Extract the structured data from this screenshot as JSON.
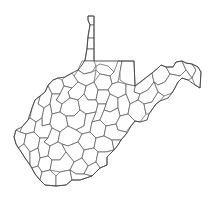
{
  "map": {
    "subject": "West Virginia county boundaries",
    "background": "#ffffff",
    "stroke_color": "#555555",
    "fill_color": "#ffffff",
    "width": 211,
    "height": 206,
    "state_outline": "M88,16 L94,16 L94,61 L134,61 L135,86 L143,80 L152,73 L158,68 L161,65 L166,67 L173,67 L176,62 L182,61 L186,63 L192,64 L198,67 L201,72 L200,88 L195,85 L188,80 L182,78 L178,82 L175,88 L172,93 L168,98 L160,101 L156,104 L149,114 L147,120 L140,122 L135,121 L131,126 L127,133 L121,140 L118,145 L114,150 L107,157 L107,165 L100,168 L92,176 L80,180 L72,180 L66,185 L56,186 L45,185 L40,180 L35,174 L30,165 L25,158 L20,150 L16,144 L14,137 L16,130 L22,127 L28,120 L32,108 L35,100 L40,96 L45,92 L48,85 L53,80 L58,78 L65,77 L72,73 L78,70 L82,65 L85,60 L87,48 L88,36 L90,25 L88,20 Z",
    "counties": [
      "M88,16 L94,16 L94,25 L90,25 L88,20 Z",
      "M90,25 L94,25 L94,38 L88,38 Z",
      "M88,38 L94,38 L94,49 L87,49 Z",
      "M87,49 L94,49 L94,61 L85,61 Z",
      "M82,61 L94,61 L96,66 L92,72 L84,74 L78,70 Z",
      "M96,66 L100,64 L108,66 L114,72 L110,76 L100,74 L96,70 Z",
      "M114,72 L118,61 L122,61 L120,72 L118,82 L112,84 L110,76 Z",
      "M122,61 L134,61 L135,86 L126,84 L120,80 L120,72 Z",
      "M135,86 L143,80 L152,73 L154,82 L148,90 L140,94 L134,92 Z",
      "M152,73 L158,68 L161,65 L166,67 L170,74 L165,82 L158,85 L154,82 Z",
      "M166,67 L173,67 L176,62 L182,61 L186,70 L180,76 L170,74 Z",
      "M182,61 L186,63 L192,64 L196,70 L192,78 L186,70 Z",
      "M192,64 L198,67 L201,72 L200,88 L195,85 L192,78 L196,70 Z",
      "M100,74 L110,76 L112,84 L108,90 L98,90 L94,82 Z",
      "M112,84 L118,82 L126,84 L126,94 L118,98 L110,94 L108,90 Z",
      "M126,84 L135,86 L134,92 L140,94 L138,100 L130,104 L126,94 Z",
      "M154,82 L158,85 L165,82 L170,74 L180,76 L186,70 L192,78 L188,80 L182,78 L178,82 L172,93 L164,96 L158,92 Z",
      "M140,94 L148,90 L154,82 L158,92 L152,102 L144,104 L138,100 Z",
      "M78,70 L84,74 L92,72 L96,70 L94,82 L86,86 L78,82 L74,76 Z",
      "M65,77 L72,73 L74,76 L78,82 L72,88 L64,86 L62,80 Z",
      "M53,80 L58,78 L62,80 L64,86 L60,94 L52,94 L48,86 Z",
      "M86,86 L94,82 L98,90 L96,100 L88,100 L84,94 Z",
      "M72,88 L78,82 L86,86 L84,94 L78,100 L70,98 L68,92 Z",
      "M60,94 L64,86 L72,88 L68,92 L70,98 L62,104 L56,100 Z",
      "M98,90 L108,90 L110,94 L106,104 L98,104 L96,100 Z",
      "M110,94 L118,98 L118,108 L110,112 L104,110 L106,104 Z",
      "M118,98 L126,94 L130,104 L128,114 L120,116 L118,108 Z",
      "M130,104 L138,100 L144,104 L146,114 L140,122 L135,121 L128,114 Z",
      "M144,104 L152,102 L158,92 L164,96 L160,101 L156,104 L149,114 L146,114 Z",
      "M40,96 L45,92 L48,86 L52,94 L50,104 L44,108 L38,104 Z",
      "M52,94 L60,94 L56,100 L62,104 L60,112 L52,114 L50,104 Z",
      "M62,104 L70,98 L78,100 L80,110 L74,116 L66,116 L60,112 Z",
      "M78,100 L84,94 L88,100 L96,100 L98,104 L96,112 L86,114 L80,110 Z",
      "M98,104 L106,104 L104,110 L100,120 L92,122 L96,112 Z",
      "M104,110 L110,112 L118,108 L120,116 L116,124 L106,126 L100,120 Z",
      "M120,116 L128,114 L135,121 L131,126 L126,132 L118,130 L116,124 Z",
      "M32,108 L35,100 L40,96 L38,104 L44,108 L42,118 L36,122 L30,118 Z",
      "M44,108 L50,104 L52,114 L50,124 L42,126 L42,118 Z",
      "M52,114 L60,112 L66,116 L68,126 L60,132 L52,128 L50,124 Z",
      "M66,116 L74,116 L80,110 L86,114 L84,126 L76,130 L68,126 Z",
      "M86,114 L96,112 L92,122 L90,132 L82,134 L76,130 L84,126 Z",
      "M92,122 L100,120 L106,126 L104,136 L96,138 L90,132 Z",
      "M106,126 L116,124 L118,130 L126,132 L127,133 L121,140 L112,140 L104,136 Z",
      "M22,127 L28,120 L30,118 L36,122 L34,132 L26,134 L20,132 Z",
      "M36,122 L42,118 L42,126 L50,124 L52,128 L48,138 L40,138 L34,132 Z",
      "M52,128 L60,132 L58,142 L50,146 L44,142 L48,138 Z",
      "M60,132 L68,126 L76,130 L82,134 L78,142 L68,146 L62,144 L58,142 Z",
      "M82,134 L90,132 L96,138 L94,148 L84,150 L78,142 Z",
      "M96,138 L104,136 L112,140 L114,150 L106,152 L98,152 L94,148 Z",
      "M112,140 L121,140 L118,145 L114,150 Z",
      "M14,137 L16,130 L20,132 L26,134 L24,144 L18,148 L16,144 Z",
      "M26,134 L34,132 L40,138 L38,148 L30,152 L24,144 Z",
      "M40,138 L48,138 L44,142 L50,146 L48,156 L40,158 L38,148 Z",
      "M50,146 L58,142 L62,144 L66,152 L60,160 L52,160 L48,156 Z",
      "M62,144 L68,146 L78,142 L84,150 L82,158 L74,162 L66,152 Z",
      "M84,150 L94,148 L98,152 L96,162 L88,166 L82,158 Z",
      "M98,152 L106,152 L114,150 L107,157 L107,165 L100,168 L96,162 Z",
      "M18,148 L24,144 L30,152 L30,165 L25,158 L20,150 Z",
      "M30,152 L38,148 L40,158 L38,166 L32,168 L30,165 Z",
      "M40,158 L48,156 L52,160 L50,170 L42,172 L38,166 Z",
      "M52,160 L60,160 L66,152 L74,162 L70,170 L60,172 L50,170 Z",
      "M74,162 L82,158 L88,166 L84,174 L76,174 L70,170 Z",
      "M88,166 L96,162 L100,168 L92,176 L84,174 Z",
      "M32,168 L38,166 L42,172 L40,180 L35,174 Z",
      "M42,172 L50,170 L56,176 L56,186 L45,185 L40,180 Z",
      "M56,176 L60,172 L70,170 L72,180 L66,185 L56,186 Z",
      "M70,170 L76,174 L84,174 L92,176 L80,180 L72,180 Z"
    ]
  }
}
